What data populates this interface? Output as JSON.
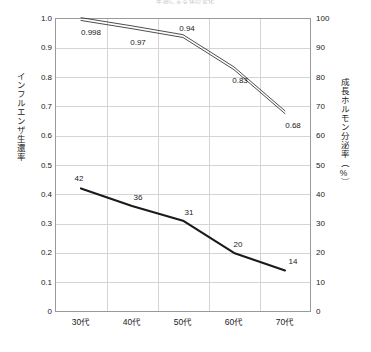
{
  "chart_data": {
    "type": "line",
    "title": "年齢による体の変化",
    "categories": [
      "30代",
      "40代",
      "50代",
      "60代",
      "70代"
    ],
    "series": [
      {
        "name": "インフルエンザ生還率",
        "axis": "left",
        "style": "double-line",
        "values": [
          0.998,
          0.97,
          0.94,
          0.83,
          0.68
        ],
        "labels": [
          "0.998",
          "0.97",
          "0.94",
          "0.83",
          "0.68"
        ]
      },
      {
        "name": "成長ホルモン分泌率（%）",
        "axis": "right",
        "style": "thick-line",
        "values": [
          42,
          36,
          31,
          20,
          14
        ],
        "labels": [
          "42",
          "36",
          "31",
          "20",
          "14"
        ]
      }
    ],
    "ylabel": "インフルエンザ生還率",
    "ylabel_right": "成長ホルモン分泌率（%）",
    "xlabel": "",
    "ylim": [
      0,
      1.0
    ],
    "ylim_right": [
      0,
      100
    ],
    "yticks": [
      "0",
      "0.1",
      "0.2",
      "0.3",
      "0.4",
      "0.5",
      "0.6",
      "0.7",
      "0.8",
      "0.9",
      "1.0"
    ],
    "yticks_right": [
      "0",
      "10",
      "20",
      "30",
      "40",
      "50",
      "60",
      "70",
      "80",
      "90",
      "100"
    ],
    "grid": true,
    "legend": "none"
  },
  "axes": {
    "left_title": "インフルエンザ生還率",
    "right_title": "成長ホルモン分泌率（%）"
  },
  "colors": {
    "line_primary": "#1a1a1a",
    "line_secondary": "#3a3a3a",
    "grid": "#d4d4d4",
    "frame": "#9a9a9a",
    "text": "#222222"
  }
}
